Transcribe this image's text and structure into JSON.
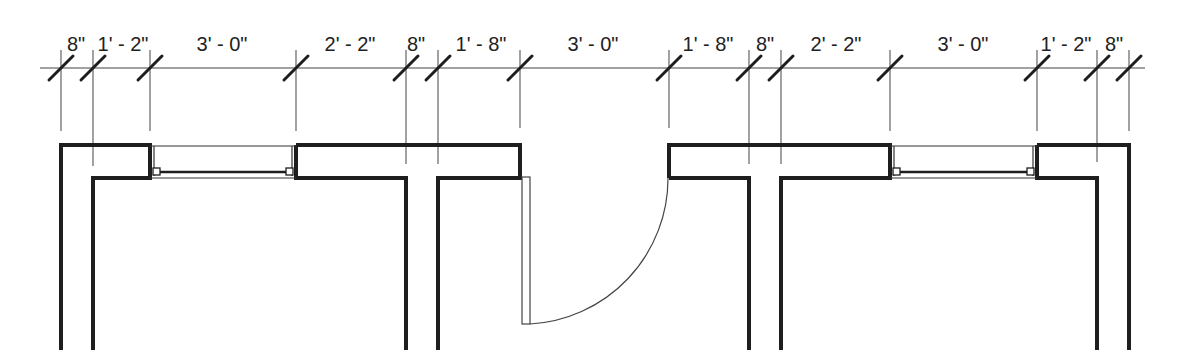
{
  "drawing": {
    "type": "floor-plan-partial",
    "units": "feet-inches"
  },
  "dimension_string": {
    "y": 68,
    "start_x": 40,
    "end_x": 1145,
    "ticks_x": [
      61,
      93,
      150,
      296,
      406,
      438,
      520,
      669,
      749,
      781,
      890,
      1037,
      1097,
      1129
    ],
    "segments": [
      {
        "label": "8\"",
        "from": 61,
        "to": 93,
        "label_x": 76
      },
      {
        "label": "1' - 2\"",
        "from": 93,
        "to": 150,
        "label_x": 123
      },
      {
        "label": "3' - 0\"",
        "from": 150,
        "to": 296,
        "label_x": 222
      },
      {
        "label": "2' - 2\"",
        "from": 296,
        "to": 406,
        "label_x": 350
      },
      {
        "label": "8\"",
        "from": 406,
        "to": 438,
        "label_x": 416
      },
      {
        "label": "1' - 8\"",
        "from": 438,
        "to": 520,
        "label_x": 481
      },
      {
        "label": "3' - 0\"",
        "from": 520,
        "to": 669,
        "label_x": 593
      },
      {
        "label": "1' - 8\"",
        "from": 669,
        "to": 749,
        "label_x": 708
      },
      {
        "label": "8\"",
        "from": 749,
        "to": 781,
        "label_x": 765
      },
      {
        "label": "2' - 2\"",
        "from": 781,
        "to": 890,
        "label_x": 836
      },
      {
        "label": "3' - 0\"",
        "from": 890,
        "to": 1037,
        "label_x": 963
      },
      {
        "label": "1' - 2\"",
        "from": 1037,
        "to": 1097,
        "label_x": 1066
      },
      {
        "label": "8\"",
        "from": 1097,
        "to": 1129,
        "label_x": 1114
      }
    ]
  },
  "elements": {
    "windows": [
      {
        "name": "window-left",
        "width_label": "3' - 0\"",
        "x1": 150,
        "x2": 296
      },
      {
        "name": "window-right",
        "width_label": "3' - 0\"",
        "x1": 890,
        "x2": 1037
      }
    ],
    "door": {
      "name": "door-center",
      "width_label": "3' - 0\"",
      "hinge_x": 520,
      "strike_x": 669,
      "swing": "inward-quarter-arc"
    },
    "interior_walls": [
      {
        "name": "interior-wall-left",
        "thickness_label": "8\"",
        "x1": 93,
        "x2": 93
      },
      {
        "name": "interior-wall-center-left",
        "thickness_label": "8\"",
        "x1": 406,
        "x2": 438
      },
      {
        "name": "interior-wall-center-right",
        "thickness_label": "8\"",
        "x1": 749,
        "x2": 781
      },
      {
        "name": "interior-wall-right",
        "thickness_label": "8\"",
        "x1": 1097,
        "x2": 1129
      }
    ]
  },
  "colors": {
    "wall": "#1e1e1e",
    "dim_line": "#444444",
    "thin_line": "#555555",
    "text": "#222222",
    "background": "#ffffff"
  }
}
